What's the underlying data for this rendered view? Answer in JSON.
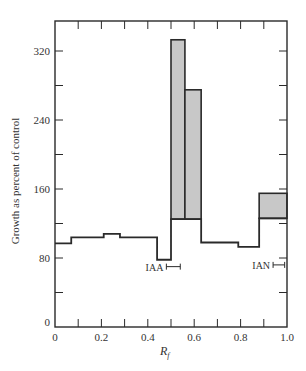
{
  "chart_data": {
    "type": "bar",
    "title": "",
    "xlabel": "R_f",
    "xlabel_main": "R",
    "xlabel_sub": "f",
    "ylabel": "Growth as percent of control",
    "xlim": [
      0,
      1.0
    ],
    "ylim": [
      0,
      356
    ],
    "x_ticks": [
      0,
      0.2,
      0.4,
      0.6,
      0.8,
      1.0
    ],
    "x_tick_labels": [
      "0",
      "0.2",
      "0.4",
      "0.6",
      "0.8",
      "1.0"
    ],
    "x_minor_ticks": [
      0.1,
      0.3,
      0.5,
      0.7,
      0.9
    ],
    "y_ticks": [
      0,
      80,
      160,
      240,
      320
    ],
    "y_tick_labels": [
      "0",
      "80",
      "160",
      "240",
      "320"
    ],
    "y_minor_ticks": [
      40,
      120,
      200,
      280
    ],
    "grid": false,
    "series": [
      {
        "name": "Control step histogram",
        "style": "step-outline",
        "segments": [
          {
            "x0": 0.0,
            "x1": 0.07,
            "value": 97
          },
          {
            "x0": 0.07,
            "x1": 0.21,
            "value": 104
          },
          {
            "x0": 0.21,
            "x1": 0.28,
            "value": 108
          },
          {
            "x0": 0.28,
            "x1": 0.44,
            "value": 104
          },
          {
            "x0": 0.44,
            "x1": 0.5,
            "value": 78
          },
          {
            "x0": 0.5,
            "x1": 0.63,
            "value": 125
          },
          {
            "x0": 0.63,
            "x1": 0.79,
            "value": 98
          },
          {
            "x0": 0.79,
            "x1": 0.88,
            "value": 93
          },
          {
            "x0": 0.88,
            "x1": 1.0,
            "value": 126
          }
        ]
      },
      {
        "name": "Increased growth (shaded)",
        "style": "shaded",
        "color": "#c8c8c8",
        "segments": [
          {
            "x0": 0.5,
            "x1": 0.56,
            "base": 125,
            "value": 333
          },
          {
            "x0": 0.56,
            "x1": 0.63,
            "base": 125,
            "value": 275
          },
          {
            "x0": 0.88,
            "x1": 1.0,
            "base": 126,
            "value": 155
          }
        ]
      }
    ],
    "annotations": [
      {
        "text": "IAA",
        "x_range": [
          0.48,
          0.54
        ],
        "y": 70
      },
      {
        "text": "IAN",
        "x_range": [
          0.94,
          0.99
        ],
        "y": 72
      }
    ]
  }
}
